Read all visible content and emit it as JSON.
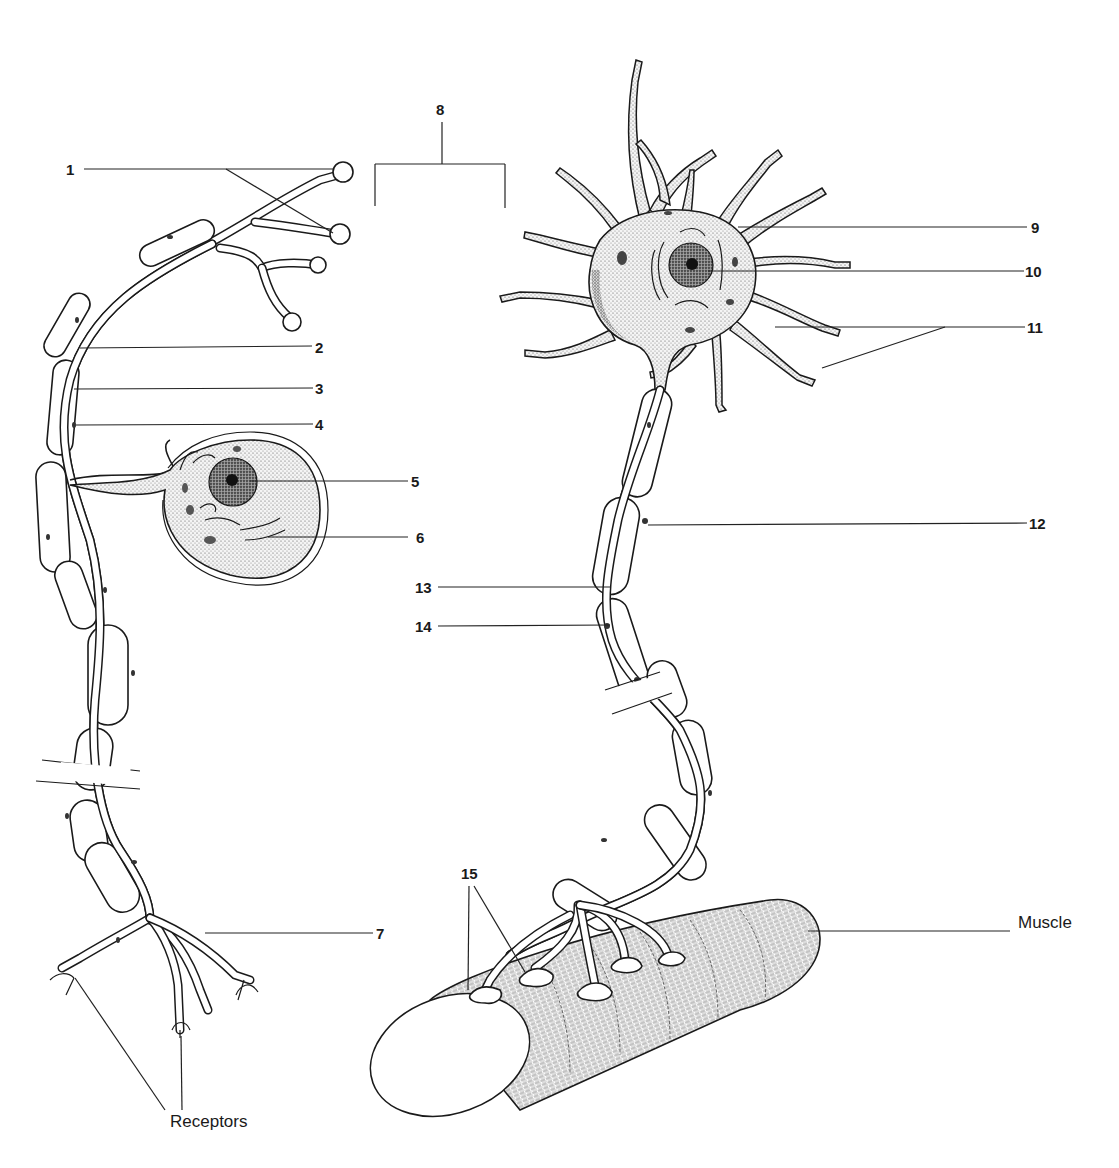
{
  "figure": {
    "left_neuron": "sensory neuron (unipolar)",
    "right_neuron": "motor neuron (multipolar)"
  },
  "labels": {
    "l1": "1",
    "l2": "2",
    "l3": "3",
    "l4": "4",
    "l5": "5",
    "l6": "6",
    "l7": "7",
    "l8": "8",
    "l9": "9",
    "l10": "10",
    "l11": "11",
    "l12": "12",
    "l13": "13",
    "l14": "14",
    "l15": "15",
    "receptors": "Receptors",
    "muscle": "Muscle"
  },
  "colors": {
    "ink": "#1a1a1a",
    "background": "#ffffff",
    "stipple": "#555555"
  }
}
